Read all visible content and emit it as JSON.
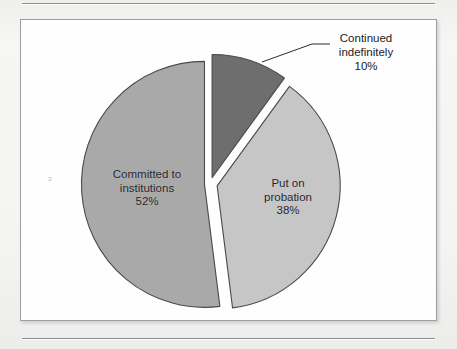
{
  "figure": {
    "background_color": "#f2f2f1",
    "frame_color": "#9b9ea3",
    "frame_fill": "#fefefe",
    "rule_color": "#8e9095"
  },
  "labels": {
    "committed": {
      "line1": "Committed to",
      "line2": "institutions",
      "percent": "52%"
    },
    "probation": {
      "line1": "Put on",
      "line2": "probation",
      "percent": "38%"
    },
    "continued": {
      "line1": "Continued",
      "line2": "indefinitely",
      "percent": "10%"
    }
  },
  "artifact": {
    "speck": "ɔ"
  },
  "ghost_text": {
    "top_left": "of the juveniles",
    "top_mid": "court outcomes for",
    "top_right": "referred cases",
    "bottom": "Figure  disposition of delinquency cases petitioned"
  },
  "chart_data": {
    "type": "pie",
    "title": "",
    "categories": [
      "Committed to institutions",
      "Put on probation",
      "Continued indefinitely"
    ],
    "values": [
      52,
      38,
      10
    ],
    "value_labels": [
      "52%",
      "38%",
      "10%"
    ],
    "units": "percent",
    "colors": [
      "#a9a9a9",
      "#c6c6c6",
      "#6e6e6e"
    ],
    "edge_color": "#4a4a4a",
    "exploded": true,
    "explode_offsets": [
      0.045,
      0.06,
      0.055
    ],
    "start_angle_deg": 90,
    "direction": "counterclockwise",
    "legend": "none",
    "labels_placement": [
      "inside",
      "inside",
      "outside-with-leader"
    ],
    "leader_lines": [
      {
        "series": "Continued indefinitely",
        "from": [
          262,
          62
        ],
        "to": [
          312,
          44
        ]
      }
    ],
    "geometry": {
      "center": [
        210,
        184
      ],
      "radius": 123
    }
  }
}
